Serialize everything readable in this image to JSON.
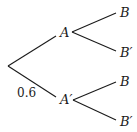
{
  "diagram": {
    "type": "probability-tree",
    "nodes": {
      "a": "A",
      "a_prime": "A′",
      "a_b": "B",
      "a_b_prime": "B′",
      "ap_b": "B",
      "ap_b_prime": "B′"
    },
    "edge_labels": {
      "root_to_a_prime": "0.6"
    },
    "colors": {
      "line": "#1a1a1a",
      "background": "#ffffff"
    }
  }
}
